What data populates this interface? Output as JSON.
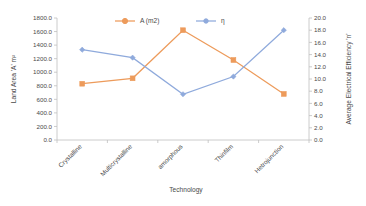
{
  "chart_data": {
    "type": "line",
    "title": "",
    "xlabel": "Technology",
    "categories": [
      "Crystalline",
      "Multicrystalline",
      "amorphous",
      "Thinfilm",
      "Hetrojunction"
    ],
    "grid": false,
    "legend_position": "top-center",
    "series": [
      {
        "name": "A (m2)",
        "axis": "left",
        "color": "#ED9B5B",
        "marker": "square",
        "values": [
          830,
          910,
          1620,
          1180,
          680
        ]
      },
      {
        "name": "η",
        "axis": "right",
        "color": "#8FAADC",
        "marker": "diamond",
        "values": [
          14.8,
          13.5,
          7.5,
          10.4,
          18.0
        ]
      }
    ],
    "left_axis": {
      "label": "Land Area 'A' m²",
      "min": 0.0,
      "max": 1800.0,
      "step": 200.0,
      "ticks": [
        "0.0",
        "200.0",
        "400.0",
        "600.0",
        "800.0",
        "1000.0",
        "1200.0",
        "1400.0",
        "1600.0",
        "1800.0"
      ]
    },
    "right_axis": {
      "label": "Average Electrical Efficiency 'n'",
      "min": 0.0,
      "max": 20.0,
      "step": 2.0,
      "ticks": [
        "0.0",
        "2.0",
        "4.0",
        "6.0",
        "8.0",
        "10.0",
        "12.0",
        "14.0",
        "16.0",
        "18.0",
        "20.0"
      ]
    }
  },
  "legend": {
    "entries": [
      {
        "label": "A (m2)",
        "color": "#ED9B5B"
      },
      {
        "label": "η",
        "color": "#8FAADC"
      }
    ]
  },
  "axis_titles": {
    "left": "Land Area 'A' m²",
    "right": "Average Electrical Efficiency 'n'",
    "bottom": "Technology"
  },
  "left_ticks": [
    "1800.0",
    "1600.0",
    "1400.0",
    "1200.0",
    "1000.0",
    "800.0",
    "600.0",
    "400.0",
    "200.0",
    "0.0"
  ],
  "right_ticks": [
    "20.0",
    "18.0",
    "16.0",
    "14.0",
    "12.0",
    "10.0",
    "8.0",
    "6.0",
    "4.0",
    "2.0",
    "0.0"
  ],
  "categories": [
    "Crystalline",
    "Multicrystalline",
    "amorphous",
    "Thinfilm",
    "Hetrojunction"
  ],
  "colors": {
    "series_a": "#ED9B5B",
    "series_eta": "#8FAADC",
    "axis": "#bfbfbf",
    "text": "#4a4a4a",
    "background": "#ffffff"
  }
}
